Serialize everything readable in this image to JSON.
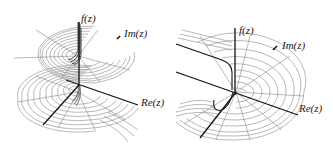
{
  "figure": {
    "colors": {
      "background": "#ffffff",
      "axis": "#1a1a1a",
      "mesh": "#8a8a8a",
      "mesh_dark": "#3a3a3a"
    },
    "panels": [
      {
        "id": "left",
        "labels": {
          "vertical_axis": "f(z)",
          "imag_axis": "Im(z)",
          "real_axis": "Re(z)"
        }
      },
      {
        "id": "right",
        "labels": {
          "vertical_axis": "f(z)",
          "imag_axis": "Im(z)",
          "real_axis": "Re(z)"
        }
      }
    ]
  }
}
